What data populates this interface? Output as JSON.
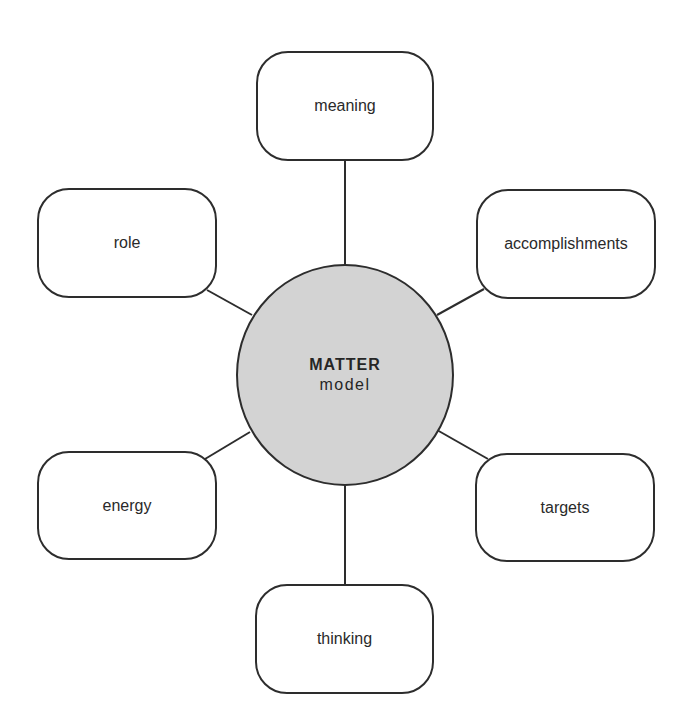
{
  "diagram": {
    "type": "hub-and-spoke",
    "colors": {
      "hub_fill": "#d3d3d3",
      "stroke": "#2d2d2d",
      "text": "#2a2a2a",
      "node_fill": "#ffffff"
    },
    "hub": {
      "title": "MATTER",
      "subtitle": "model"
    },
    "nodes": [
      {
        "id": "meaning",
        "label": "meaning",
        "position": "top"
      },
      {
        "id": "accomplishments",
        "label": "accomplishments",
        "position": "upper-right"
      },
      {
        "id": "targets",
        "label": "targets",
        "position": "lower-right"
      },
      {
        "id": "thinking",
        "label": "thinking",
        "position": "bottom"
      },
      {
        "id": "energy",
        "label": "energy",
        "position": "lower-left"
      },
      {
        "id": "role",
        "label": "role",
        "position": "upper-left"
      }
    ]
  }
}
